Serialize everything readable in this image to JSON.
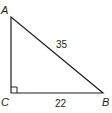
{
  "diagram": {
    "type": "right-triangle",
    "vertices": {
      "A": {
        "label": "A"
      },
      "B": {
        "label": "B"
      },
      "C": {
        "label": "C"
      }
    },
    "right_angle_at": "C",
    "sides": {
      "AB": {
        "label": "35"
      },
      "CB": {
        "label": "22"
      }
    },
    "stroke_color": "#231f20"
  }
}
